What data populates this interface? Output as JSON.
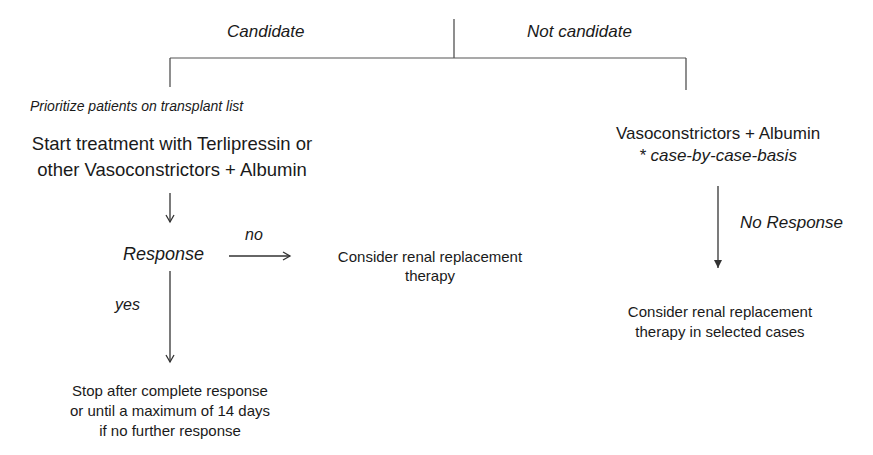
{
  "diagram": {
    "branches": {
      "left_label": "Candidate",
      "right_label": "Not candidate"
    },
    "left": {
      "note": "Prioritize patients on transplant list",
      "treatment_line1": "Start treatment with Terlipressin or",
      "treatment_line2": "other Vasoconstrictors + Albumin",
      "response_label": "Response",
      "no_label": "no",
      "yes_label": "yes",
      "no_outcome_line1": "Consider renal replacement",
      "no_outcome_line2": "therapy",
      "yes_outcome_line1": "Stop after complete response",
      "yes_outcome_line2": "or until a maximum of 14 days",
      "yes_outcome_line3": "if no further response"
    },
    "right": {
      "treatment_line1": "Vasoconstrictors + Albumin",
      "treatment_line2": "* case-by-case-basis",
      "no_response_label": "No Response",
      "outcome_line1": "Consider renal replacement",
      "outcome_line2": "therapy in selected cases"
    },
    "colors": {
      "text": "#1a1a1a",
      "lines": "#333333",
      "background": "#ffffff"
    }
  }
}
